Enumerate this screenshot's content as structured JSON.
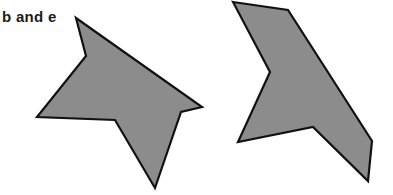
{
  "caption": "b and e",
  "colors": {
    "fill": "#8c8c8c",
    "stroke": "#111111"
  },
  "shapes": [
    {
      "name": "shape-b",
      "points": "76,18 86,56 37,117 115,120 155,188 181,112 202,107"
    },
    {
      "name": "shape-e",
      "points": "233,2 288,10 372,141 368,181 313,127 238,142 270,72"
    }
  ]
}
